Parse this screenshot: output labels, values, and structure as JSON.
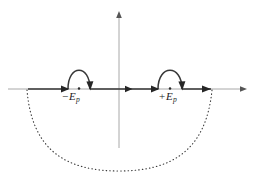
{
  "figure": {
    "type": "contour-diagram",
    "background_color": "#ffffff",
    "axis_color": "#a8a8a8",
    "contour_color": "#383838",
    "arc_color": "#3a3a3a",
    "label_color": "#1c1c1c"
  },
  "axes": {
    "real": {
      "name": "real-axis",
      "y": 89,
      "x_start": 8,
      "x_end": 246,
      "arrow_at_end": true
    },
    "imaginary": {
      "name": "imaginary-axis",
      "x": 119,
      "y_top": 12,
      "y_bottom": 148,
      "arrow_at_top": true
    }
  },
  "poles": [
    {
      "id": "pole-negative",
      "label_sign": "−",
      "label_symbol": "E",
      "label_subscript": "p",
      "label_text": "−E_p",
      "x": 79,
      "y": 89,
      "detour": "above"
    },
    {
      "id": "pole-positive",
      "label_sign": "+",
      "label_symbol": "E",
      "label_subscript": "p",
      "label_text": "+E_p",
      "x": 170,
      "y": 89,
      "detour": "above"
    }
  ],
  "contour": {
    "name": "integration-contour",
    "direction": "left-to-right",
    "segments": [
      {
        "type": "line",
        "from_x": 28,
        "to_x": 68,
        "y": 89
      },
      {
        "type": "semicircle-above",
        "from_x": 68,
        "to_x": 90,
        "peak_y": 66
      },
      {
        "type": "line",
        "from_x": 90,
        "to_x": 158,
        "y": 89
      },
      {
        "type": "semicircle-above",
        "from_x": 158,
        "to_x": 182,
        "peak_y": 66
      },
      {
        "type": "line",
        "from_x": 182,
        "to_x": 211,
        "y": 89
      }
    ],
    "direction_arrows_x": [
      66,
      88,
      131,
      156,
      180,
      209
    ]
  },
  "closing_arc": {
    "name": "lower-half-plane-closing-arc",
    "style": "dotted",
    "start_x": 27,
    "start_y": 90,
    "end_x": 212,
    "end_y": 90,
    "bottom_y": 171,
    "center_x": 119
  }
}
